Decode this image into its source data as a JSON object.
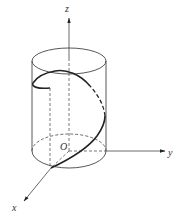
{
  "figure": {
    "axes": {
      "x_label": "x",
      "y_label": "y",
      "z_label": "z",
      "origin_label": "O"
    },
    "colors": {
      "line": "#333333",
      "thin_line": "#555555",
      "background": "#ffffff"
    }
  }
}
